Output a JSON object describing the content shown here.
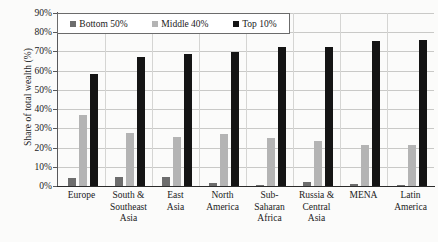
{
  "chart_data": {
    "type": "bar",
    "title": "",
    "xlabel": "",
    "ylabel": "Share of total wealth (%)",
    "ylim": [
      0,
      90
    ],
    "ytick_labels": [
      "90%",
      "80%",
      "70%",
      "60%",
      "50%",
      "40%",
      "30%",
      "20%",
      "10%",
      "0%"
    ],
    "ytick_values": [
      90,
      80,
      70,
      60,
      50,
      40,
      30,
      20,
      10,
      0
    ],
    "grid": true,
    "legend_position": "top-left-inside",
    "categories": [
      "Europe",
      "South & Southeast Asia",
      "East Asia",
      "North America",
      "Sub-Saharan Africa",
      "Russia & Central Asia",
      "MENA",
      "Latin America"
    ],
    "category_lines": [
      [
        "Europe"
      ],
      [
        "South &",
        "Southeast",
        "Asia"
      ],
      [
        "East",
        "Asia"
      ],
      [
        "North",
        "America"
      ],
      [
        "Sub-",
        "Saharan",
        "Africa"
      ],
      [
        "Russia &",
        "Central",
        "Asia"
      ],
      [
        "MENA"
      ],
      [
        "Latin",
        "America"
      ]
    ],
    "series": [
      {
        "name": "Bottom 50%",
        "color": "#6d6d6d",
        "values": [
          4.3,
          4.5,
          4.6,
          1.4,
          0.7,
          2.3,
          0.8,
          0.3
        ]
      },
      {
        "name": "Middle 40%",
        "color": "#b4b4b4",
        "values": [
          37.2,
          27.6,
          25.7,
          27.3,
          25.2,
          23.2,
          21.2,
          21.5
        ]
      },
      {
        "name": "Top 10%",
        "color": "#141414",
        "values": [
          58.3,
          67.2,
          68.6,
          69.6,
          72.4,
          72.4,
          75.7,
          76.0
        ]
      }
    ]
  }
}
